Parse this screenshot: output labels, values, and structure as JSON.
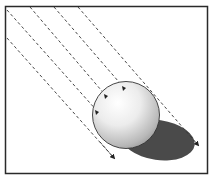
{
  "diagram": {
    "colors": {
      "frame": "#2a2a2a",
      "ray": "#333333",
      "shadow": "#4a4a4a",
      "sphere_light": "#ffffff",
      "sphere_dark": "#9a9a9a",
      "background": "#ffffff"
    },
    "ray_count": 5,
    "arrow_count_on_sphere": 3
  }
}
